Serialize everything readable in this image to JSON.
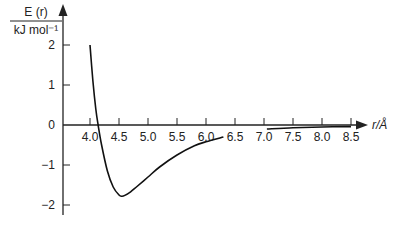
{
  "chart_data": {
    "type": "line",
    "title": "",
    "xlabel": "r/Å",
    "ylabel_top": "E (r)",
    "ylabel_bottom": "kJ mol⁻¹",
    "xlim": [
      3.5,
      9.0
    ],
    "ylim": [
      -2.2,
      2.3
    ],
    "x_ticks": [
      4.0,
      4.5,
      5.0,
      5.5,
      6.0,
      6.5,
      7.0,
      7.5,
      8.0,
      8.5
    ],
    "x_tick_labels": [
      "4.0",
      "4.5",
      "5.0",
      "5.5",
      "6.0",
      "6.5",
      "7.0",
      "7.5",
      "8.0",
      "8.5"
    ],
    "y_ticks": [
      2,
      1,
      0,
      -1,
      -2
    ],
    "y_tick_labels": [
      "2",
      "1",
      "0",
      "−1",
      "−2"
    ],
    "grid": false,
    "legend": null,
    "series": [
      {
        "name": "E(r)",
        "segments": [
          {
            "x": [
              4.0,
              4.05,
              4.1,
              4.14,
              4.2,
              4.3,
              4.4,
              4.5,
              4.55,
              4.6,
              4.7,
              4.8,
              5.0,
              5.2,
              5.5,
              5.8,
              6.0,
              6.3
            ],
            "y": [
              2.0,
              1.1,
              0.4,
              0.0,
              -0.5,
              -1.15,
              -1.55,
              -1.75,
              -1.78,
              -1.76,
              -1.67,
              -1.55,
              -1.3,
              -1.05,
              -0.75,
              -0.52,
              -0.42,
              -0.3
            ]
          },
          {
            "x": [
              7.05,
              7.5,
              8.0,
              8.5
            ],
            "y": [
              -0.1,
              -0.07,
              -0.05,
              -0.04
            ]
          }
        ]
      }
    ],
    "colors": {
      "line": "#111111",
      "axis": "#222222",
      "text": "#222222"
    }
  }
}
